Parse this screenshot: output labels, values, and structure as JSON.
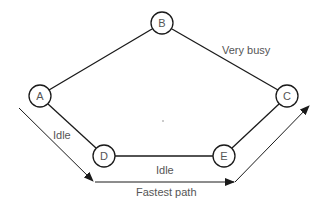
{
  "diagram": {
    "type": "network-graph",
    "nodes": [
      {
        "id": "A",
        "label": "A",
        "cx": 40,
        "cy": 96
      },
      {
        "id": "B",
        "label": "B",
        "cx": 162,
        "cy": 23
      },
      {
        "id": "C",
        "label": "C",
        "cx": 287,
        "cy": 96
      },
      {
        "id": "D",
        "label": "D",
        "cx": 104,
        "cy": 156
      },
      {
        "id": "E",
        "label": "E",
        "cx": 224,
        "cy": 156
      }
    ],
    "edges": [
      {
        "from": "A",
        "to": "B",
        "label": ""
      },
      {
        "from": "B",
        "to": "C",
        "label": "Very busy"
      },
      {
        "from": "A",
        "to": "D",
        "label": "Idle"
      },
      {
        "from": "D",
        "to": "E",
        "label": "Idle"
      },
      {
        "from": "E",
        "to": "C",
        "label": ""
      }
    ],
    "labels": {
      "very_busy": "Very busy",
      "idle_left": "Idle",
      "idle_bottom": "Idle",
      "fastest_path": "Fastest path"
    },
    "fastest_path": {
      "label": "Fastest path",
      "route": [
        "A",
        "D",
        "E",
        "C"
      ]
    },
    "colors": {
      "line": "#1a1a1a",
      "text": "#555555",
      "background": "#ffffff"
    }
  }
}
